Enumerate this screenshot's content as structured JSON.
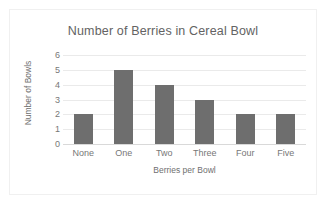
{
  "chart_data": {
    "type": "bar",
    "title": "Number of Berries in Cereal Bowl",
    "xlabel": "Berries per Bowl",
    "ylabel": "Number of Bowls",
    "categories": [
      "None",
      "One",
      "Two",
      "Three",
      "Four",
      "Five"
    ],
    "values": [
      2,
      5,
      4,
      3,
      2,
      2
    ],
    "ylim": [
      0,
      6
    ],
    "ytick_labels": [
      "6",
      "5",
      "4",
      "3",
      "2",
      "1",
      "0"
    ],
    "ytick_values": [
      6,
      5,
      4,
      3,
      2,
      1,
      0
    ],
    "grid": true,
    "legend": false,
    "bar_color": "#6e6e6e",
    "gridline_color": "#eaeaea",
    "text_color": "#777777",
    "title_color": "#636363",
    "background_color": "#ffffff",
    "border_color": "#f0f0f0"
  }
}
